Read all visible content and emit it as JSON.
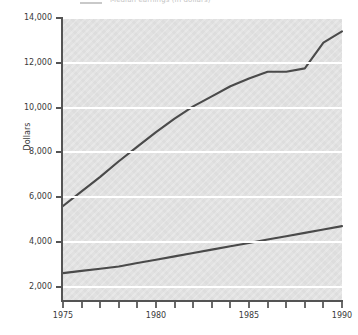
{
  "top_legend": {
    "cutoff_text": "Median earnings (in dollars)",
    "swatch_color": "#c9c9c9"
  },
  "axes": {
    "ylabel": "Dollars",
    "yticks": [
      "2,000",
      "4,000",
      "6,000",
      "8,000",
      "10,000",
      "12,000",
      "14,000"
    ],
    "xticklabels": [
      "1975",
      "1980",
      "1985",
      "1990"
    ]
  },
  "colors": {
    "plot_background": "#e1e1e1",
    "gridline": "#ffffff",
    "axis": "#545454",
    "line": "#4a4a4a"
  },
  "chart_data": {
    "type": "line",
    "title": "",
    "xlabel": "",
    "ylabel": "Dollars",
    "x": [
      1975,
      1976,
      1977,
      1978,
      1979,
      1980,
      1981,
      1982,
      1983,
      1984,
      1985,
      1986,
      1987,
      1988,
      1989,
      1990
    ],
    "xlim": [
      1975,
      1990
    ],
    "ylim": [
      1400,
      14000
    ],
    "ytick_values": [
      2000,
      4000,
      6000,
      8000,
      10000,
      12000,
      14000
    ],
    "xtick_values": [
      1975,
      1980,
      1985,
      1990
    ],
    "xtick_labels": [
      "1975",
      "1980",
      "1985",
      "1990"
    ],
    "grid": true,
    "grid_axis": "y",
    "legend": "none",
    "series": [
      {
        "name": "Upper series",
        "values": [
          5600,
          6250,
          6900,
          7600,
          8250,
          8900,
          9500,
          10050,
          10500,
          10950,
          11300,
          11600,
          11600,
          11750,
          12900,
          13400
        ]
      },
      {
        "name": "Lower series",
        "values": [
          2600,
          2700,
          2800,
          2900,
          3050,
          3200,
          3350,
          3500,
          3650,
          3800,
          3950,
          4100,
          4250,
          4400,
          4550,
          4700
        ]
      }
    ]
  }
}
